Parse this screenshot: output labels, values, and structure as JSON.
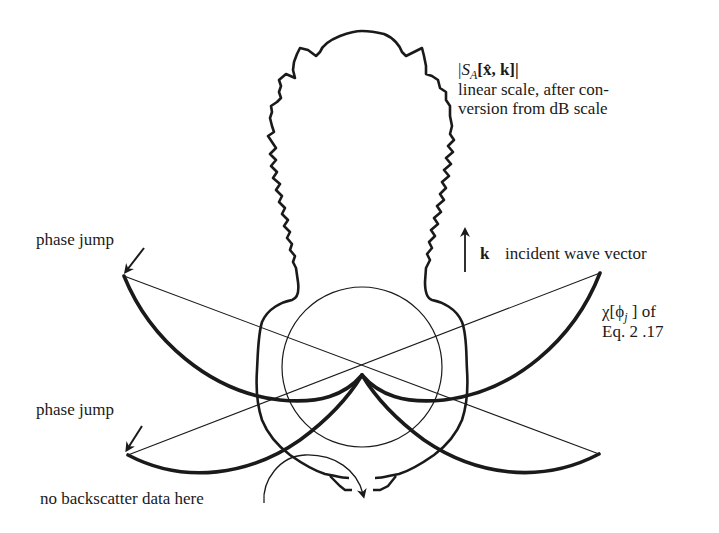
{
  "figure": {
    "type": "scattering-pattern diagram",
    "background": "#ffffff",
    "ink_color": "#1a1a1a"
  },
  "labels": {
    "magnitude_symbol": "|S_A[x̂, k]|",
    "magnitude_line1": "|",
    "magnitude_S": "S",
    "magnitude_A": "A",
    "magnitude_args": "[x̂, k]|",
    "scale_note_line1": "linear scale, after con-",
    "scale_note_line2": "version from dB scale",
    "k_symbol": "k",
    "k_label": "incident wave vector",
    "chi_line1": "χ[ϕ",
    "chi_sub": "j",
    "chi_line1_end": " ] of",
    "chi_line2": "Eq. 2 .17",
    "phase_jump_upper": "phase jump",
    "phase_jump_lower": "phase jump",
    "no_backscatter": "no backscatter data here"
  },
  "geometry": {
    "center": [
      362,
      367
    ],
    "cusp": [
      362,
      375
    ],
    "reference_circle_radius": 80,
    "upper_left_endpoint": [
      124,
      276
    ],
    "upper_right_endpoint": [
      600,
      273
    ],
    "lower_left_endpoint": [
      128,
      455
    ],
    "lower_right_endpoint": [
      599,
      454
    ]
  }
}
